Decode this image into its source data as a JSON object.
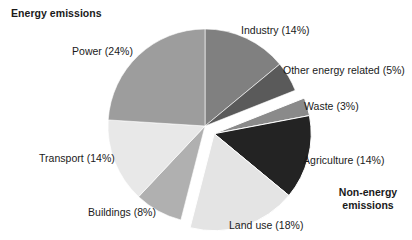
{
  "chart_data": {
    "type": "pie",
    "title": "Energy emissions",
    "xlabel": "",
    "ylabel": "",
    "legend_position": "none",
    "grid": false,
    "categories": [
      "Industry",
      "Other energy related",
      "Waste",
      "Agriculture",
      "Land use",
      "Buildings",
      "Transport",
      "Power"
    ],
    "values": [
      14,
      5,
      3,
      14,
      18,
      8,
      14,
      24
    ],
    "units": "%",
    "slices": [
      {
        "name": "Industry",
        "value": 14,
        "label": "Industry (14%)",
        "color": "#808080",
        "group": "energy",
        "exploded": false
      },
      {
        "name": "Other energy related",
        "value": 5,
        "label": "Other energy related (5%)",
        "color": "#5a5a5a",
        "group": "energy",
        "exploded": false
      },
      {
        "name": "Waste",
        "value": 3,
        "label": "Waste (3%)",
        "color": "#8a8a8a",
        "group": "non-energy",
        "exploded": true
      },
      {
        "name": "Agriculture",
        "value": 14,
        "label": "Agriculture (14%)",
        "color": "#232323",
        "group": "non-energy",
        "exploded": true
      },
      {
        "name": "Land use",
        "value": 18,
        "label": "Land use (18%)",
        "color": "#e4e4e4",
        "group": "non-energy",
        "exploded": true
      },
      {
        "name": "Buildings",
        "value": 8,
        "label": "Buildings (8%)",
        "color": "#b0b0b0",
        "group": "energy",
        "exploded": false
      },
      {
        "name": "Transport",
        "value": 14,
        "label": "Transport (14%)",
        "color": "#e8e8e8",
        "group": "energy",
        "exploded": false
      },
      {
        "name": "Power",
        "value": 24,
        "label": "Power (24%)",
        "color": "#9d9d9d",
        "group": "energy",
        "exploded": false
      }
    ],
    "annotations": [
      {
        "name": "energy-emissions",
        "text": "Energy emissions"
      },
      {
        "name": "non-energy-emissions",
        "text": "Non-energy\nemissions"
      }
    ]
  },
  "labels": {
    "industry": "Industry (14%)",
    "other_energy_related": "Other energy related (5%)",
    "waste": "Waste (3%)",
    "agriculture": "Agriculture (14%)",
    "land_use": "Land use (18%)",
    "buildings": "Buildings (8%)",
    "transport": "Transport (14%)",
    "power": "Power (24%)",
    "energy_emissions_heading": "Energy emissions",
    "non_energy_emissions_line1": "Non-energy",
    "non_energy_emissions_line2": "emissions"
  },
  "colors": {
    "background": "#ffffff",
    "text": "#1a1a1a"
  }
}
